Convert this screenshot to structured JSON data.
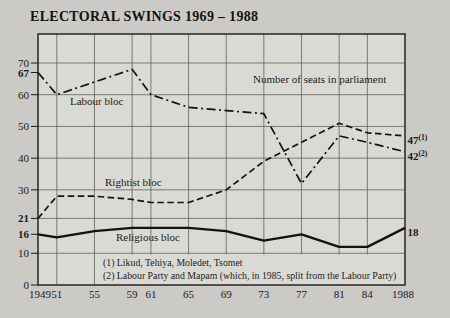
{
  "title": "ELECTORAL SWINGS 1969 – 1988",
  "chart_data": {
    "type": "line",
    "title": "ELECTORAL SWINGS 1969 – 1988",
    "annotation": "Number of seats in parliament",
    "x": [
      1949,
      1951,
      1955,
      1959,
      1961,
      1965,
      1969,
      1973,
      1977,
      1981,
      1984,
      1988
    ],
    "x_tick_labels": [
      "1949",
      "51",
      "55",
      "59",
      "61",
      "65",
      "69",
      "73",
      "77",
      "81",
      "84",
      "1988"
    ],
    "ylim": [
      0,
      79
    ],
    "y_ticks": [
      {
        "value": 70,
        "label": "70",
        "bold": false
      },
      {
        "value": 67,
        "label": "67",
        "bold": true
      },
      {
        "value": 60,
        "label": "60",
        "bold": false
      },
      {
        "value": 50,
        "label": "50",
        "bold": false
      },
      {
        "value": 40,
        "label": "40",
        "bold": false
      },
      {
        "value": 30,
        "label": "30",
        "bold": false
      },
      {
        "value": 21,
        "label": "21",
        "bold": true
      },
      {
        "value": 16,
        "label": "16",
        "bold": true
      },
      {
        "value": 10,
        "label": "10",
        "bold": false
      },
      {
        "value": 0,
        "label": "0",
        "bold": false
      }
    ],
    "h_gridlines": [
      70,
      60,
      50,
      40,
      30,
      21,
      10
    ],
    "grid": true,
    "series": [
      {
        "name": "Labour bloc",
        "style": "dashdot",
        "values": [
          67,
          60,
          64,
          68,
          60,
          56,
          55,
          54,
          32,
          47,
          45,
          42
        ],
        "end_label": "42",
        "end_label_sup": "(2)"
      },
      {
        "name": "Rightist bloc",
        "style": "dashed",
        "values": [
          21,
          28,
          28,
          27,
          26,
          26,
          30,
          39,
          45,
          51,
          48,
          47
        ],
        "end_label": "47",
        "end_label_sup": "(1)"
      },
      {
        "name": "Religious bloc",
        "style": "solid",
        "values": [
          16,
          15,
          17,
          18,
          18,
          18,
          17,
          14,
          16,
          12,
          12,
          18
        ],
        "end_label": "18",
        "end_label_sup": ""
      }
    ],
    "footnotes": [
      "(1) Likud, Tehiya, Moledet, Tsomet",
      "(2) Labour Party and Mapam (which, in 1985, split from the Labour Party)"
    ],
    "colors": {
      "line": "#14120f",
      "grid": "#5b5852",
      "border": "#1c1a16",
      "background": "#cbcac6",
      "plot_background": "#dadad5"
    }
  }
}
